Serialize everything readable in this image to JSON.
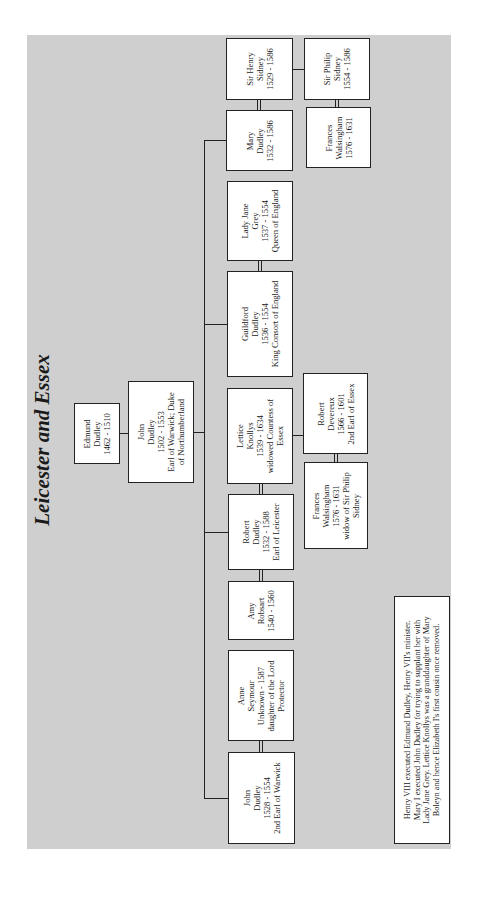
{
  "title": "Leicester and Essex",
  "people": {
    "sir_henry_sidney": {
      "lines": [
        "Sir Henry",
        "Sidney",
        "1529 - 1586"
      ]
    },
    "sir_philip_sidney": {
      "lines": [
        "Sir Philip",
        "Sidney",
        "1554 - 1586"
      ]
    },
    "mary_dudley": {
      "lines": [
        "Mary",
        "Dudley",
        "1532 - 1586"
      ]
    },
    "frances_walsingham_1": {
      "lines": [
        "Frances",
        "Walsingham",
        "1576 - 1631"
      ]
    },
    "lady_jane_grey": {
      "lines": [
        "Lady Jane",
        "Grey",
        "1537 - 1554",
        "Queen of England"
      ]
    },
    "guildford_dudley": {
      "lines": [
        "Guildford",
        "Dudley",
        "1536 - 1554",
        "King Consort of England"
      ]
    },
    "edmund_dudley": {
      "lines": [
        "Edmund",
        "Dudley",
        "1462 - 1510"
      ]
    },
    "john_dudley_1502": {
      "lines": [
        "John",
        "Dudley",
        "1502 - 1553",
        "Earl of Warwick; Duke",
        "of Northumberland"
      ]
    },
    "lettice_knollys": {
      "lines": [
        "Lettice",
        "Knollys",
        "1539 - 1634",
        "widowed Countess of",
        "Essex"
      ]
    },
    "robert_devereux": {
      "lines": [
        "Robert",
        "Devereux",
        "1566 - 1601",
        "2nd Earl of Essex"
      ]
    },
    "frances_walsingham_2": {
      "lines": [
        "Frances",
        "Walsingham",
        "1576 - 1631",
        "widow of Sir Philip",
        "Sidney"
      ]
    },
    "robert_dudley": {
      "lines": [
        "Robert",
        "Dudley",
        "1532 - 1588",
        "Earl of Leicester"
      ]
    },
    "amy_robsart": {
      "lines": [
        "Amy",
        "Robsart",
        "1540 - 1560"
      ]
    },
    "anne_seymour": {
      "lines": [
        "Anne",
        "Seymour",
        "Unknown - 1587",
        "daughter of the Lord",
        "Protector"
      ]
    },
    "john_dudley_1528": {
      "lines": [
        "John",
        "Dudley",
        "1528 - 1554",
        "2nd Earl of Warwick"
      ]
    }
  },
  "note": {
    "lines": [
      "Henry VIII executed Edmund Dudley, Henry VII's minister.",
      "Mary I executed John Dudley for trying to supplant her with",
      "Lady Jane Grey.  Lettice Knollys was a granddaughter of Mary",
      "Boleyn and hence Elizabeth I's first cousin once removed."
    ]
  },
  "colors": {
    "panel": "#cfcfcf",
    "box": "#ffffff",
    "line": "#222222"
  }
}
